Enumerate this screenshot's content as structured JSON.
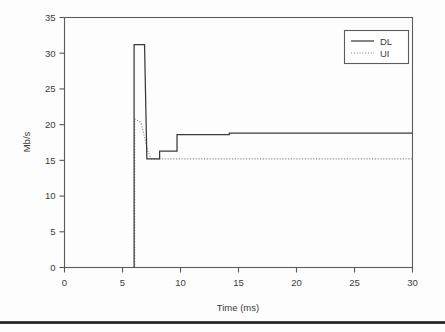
{
  "chart_data": {
    "type": "line",
    "title": "",
    "xlabel": "Time (ms)",
    "ylabel": "Mb/s",
    "xlim": [
      0,
      30
    ],
    "ylim": [
      0,
      35
    ],
    "xticks": [
      0,
      5,
      10,
      15,
      20,
      25,
      30
    ],
    "yticks": [
      0,
      5,
      10,
      15,
      20,
      25,
      30,
      35
    ],
    "xticklabels": [
      "0",
      "5",
      "10",
      "15",
      "20",
      "25",
      "30"
    ],
    "yticklabels": [
      "0",
      "5",
      "10",
      "15",
      "20",
      "25",
      "30",
      "35"
    ],
    "grid": false,
    "legend_position": "upper right",
    "series": [
      {
        "name": "DL",
        "style": "solid",
        "color": "#3a3a3a",
        "x": [
          6.0,
          6.0,
          6.9,
          7.1,
          8.2,
          8.2,
          9.7,
          9.7,
          14.2,
          14.2,
          30.0
        ],
        "y": [
          0.0,
          31.2,
          31.2,
          15.2,
          15.2,
          16.3,
          16.3,
          18.6,
          18.6,
          18.8,
          18.8
        ]
      },
      {
        "name": "UI",
        "style": "dotted",
        "color": "#8e8e8e",
        "x": [
          6.05,
          6.05,
          6.6,
          6.9,
          7.2,
          7.5,
          30.0
        ],
        "y": [
          0.0,
          20.8,
          20.3,
          18.2,
          16.2,
          15.2,
          15.2
        ]
      }
    ],
    "annotations": {
      "dl_peak_value": 31.2,
      "dl_peak_time": 6.0,
      "dl_final_value": 18.8,
      "ui_peak_value": 20.8,
      "ui_final_value": 15.2,
      "dl_min_value": 15.2
    }
  },
  "legend": {
    "entries": [
      {
        "label": "DL",
        "style": "solid"
      },
      {
        "label": "UI",
        "style": "dotted"
      }
    ]
  },
  "axes": {
    "x_title": "Time (ms)",
    "y_title": "Mb/s"
  }
}
